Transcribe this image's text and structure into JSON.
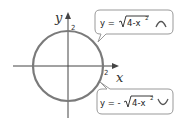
{
  "diagram": {
    "axes": {
      "x_label": "x",
      "y_label": "y",
      "x_tick": "2",
      "y_tick": "2"
    },
    "circle": {
      "radius": 2,
      "stroke_color": "#7a7a7a"
    },
    "callouts": [
      {
        "prefix": "y = ",
        "radicand": "4-x",
        "exponent": "2",
        "shape": "upper-arc-icon"
      },
      {
        "prefix": "y = -",
        "radicand": "4-x",
        "exponent": "2",
        "shape": "lower-arc-icon"
      }
    ]
  }
}
